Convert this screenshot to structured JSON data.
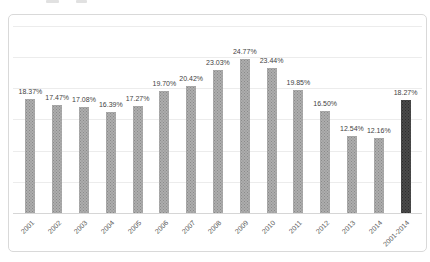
{
  "page": {
    "background": "#ffffff",
    "cropped_top_text_visible": true
  },
  "chart_data": {
    "type": "bar",
    "title": "",
    "xlabel": "",
    "ylabel": "",
    "legend": "none",
    "grid": true,
    "ylim": [
      0,
      30
    ],
    "gridline_step": 5,
    "y_axis_labels_visible": false,
    "bar_color": "#a6a6a6",
    "highlight_bar_color": "#404040",
    "highlight_index": 14,
    "categories": [
      "2001",
      "2002",
      "2003",
      "2004",
      "2005",
      "2006",
      "2007",
      "2008",
      "2009",
      "2010",
      "2011",
      "2012",
      "2013",
      "2014",
      "2001-2014"
    ],
    "values": [
      18.37,
      17.47,
      17.08,
      16.39,
      17.27,
      19.7,
      20.42,
      23.03,
      24.77,
      23.44,
      19.85,
      16.5,
      12.54,
      12.16,
      18.27
    ],
    "data_labels": [
      "18.37%",
      "17.47%",
      "17.08%",
      "16.39%",
      "17.27%",
      "19.70%",
      "20.42%",
      "23.03%",
      "24.77%",
      "23.44%",
      "19.85%",
      "16.50%",
      "12.54%",
      "12.16%",
      "18.27%"
    ]
  }
}
